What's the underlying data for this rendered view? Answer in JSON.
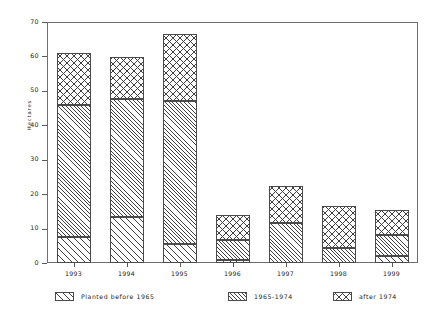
{
  "chart_data": {
    "type": "bar",
    "subtype": "stacked-bar",
    "title": "",
    "xlabel": "",
    "ylabel": "Hectares",
    "ylim": [
      0,
      70
    ],
    "yticks": [
      0,
      10,
      20,
      30,
      40,
      50,
      60,
      70
    ],
    "ytick_labels": [
      "0",
      "10",
      "20",
      "30",
      "40",
      "50",
      "60",
      "70"
    ],
    "grid": false,
    "legend_position": "below-plot",
    "categories": [
      "1993",
      "1994",
      "1995",
      "1996",
      "1997",
      "1998",
      "1999"
    ],
    "series": [
      {
        "name": "Planted before 1965",
        "pattern": "diagonal-hatch",
        "values": [
          7.5,
          13.5,
          5.5,
          1.0,
          0.0,
          0.0,
          2.0
        ]
      },
      {
        "name": "1965-1974",
        "pattern": "dense-diagonal-hatch",
        "values": [
          38.5,
          34.0,
          41.5,
          5.8,
          11.5,
          4.5,
          6.0
        ]
      },
      {
        "name": "after 1974",
        "pattern": "cross-hatch",
        "values": [
          15.0,
          12.2,
          19.5,
          7.2,
          11.0,
          12.0,
          7.5
        ]
      }
    ],
    "totals": [
      61.0,
      59.7,
      66.5,
      14.0,
      22.5,
      16.5,
      15.5
    ],
    "colors": {
      "ink": "#3f3f3f",
      "axis": "#5a5a5a",
      "frame": "#6e6e6e",
      "background": "#ffffff"
    }
  },
  "legend": {
    "items": [
      {
        "label": "Planted before 1965"
      },
      {
        "label": "1965-1974"
      },
      {
        "label": "after 1974"
      }
    ]
  }
}
